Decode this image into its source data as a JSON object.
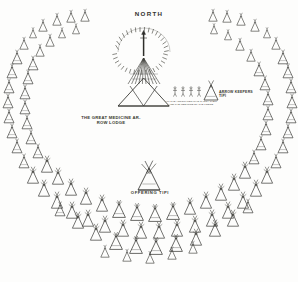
{
  "diagram": {
    "title_direction": "NORTH",
    "lodge_caption_line1": "THE GREAT MEDICINE AR-",
    "lodge_caption_line2": "ROW LODGE",
    "offering_tipi_label": "OFFERING TIPI",
    "arrow_keeper_label_line1": "ARROW KEEPERS",
    "arrow_keeper_label_line2": "TIPI",
    "figures_caption_line1": "ALL THE ARROW MEN WHO CARRY THEM",
    "figures_caption_line2": "AND THE MEDICINE OF THE LODGE",
    "ink_color": "#3a3a36",
    "paper_color": "#fdfdfc"
  },
  "camp_circle": {
    "outer_ring_tipis": 46,
    "inner_ring_tipis": 38,
    "opening_direction": "north",
    "center_structure": "great-medicine-arrow-lodge",
    "secondary_structures": [
      "offering-tipi",
      "arrow-keepers-tipi"
    ],
    "figure_count": 4
  }
}
